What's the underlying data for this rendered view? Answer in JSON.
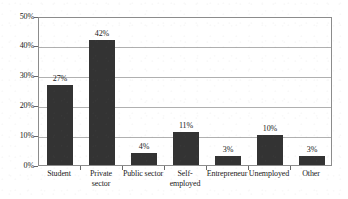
{
  "chart_data": {
    "type": "bar",
    "title": "",
    "xlabel": "",
    "ylabel": "",
    "categories": [
      "Student",
      "Private\nsector",
      "Public sector",
      "Self-\nemployed",
      "Entrepreneur",
      "Unemployed",
      "Other"
    ],
    "values": [
      27,
      42,
      4,
      11,
      3,
      10,
      3
    ],
    "value_labels": [
      "27%",
      "42%",
      "4%",
      "11%",
      "3%",
      "10%",
      "3%"
    ],
    "ylim": [
      0,
      50
    ],
    "ytick_values": [
      0,
      10,
      20,
      30,
      40,
      50
    ],
    "ytick_labels": [
      "0%",
      "10%",
      "20%",
      "30%",
      "40%",
      "50%"
    ],
    "grid": true,
    "grid_axis": "y",
    "legend": false,
    "legend_position": "none",
    "bar_color": "#333333",
    "grid_color": "#b0b0b0",
    "axis_color": "#8c8c8c",
    "background_color": "#ffffff"
  }
}
